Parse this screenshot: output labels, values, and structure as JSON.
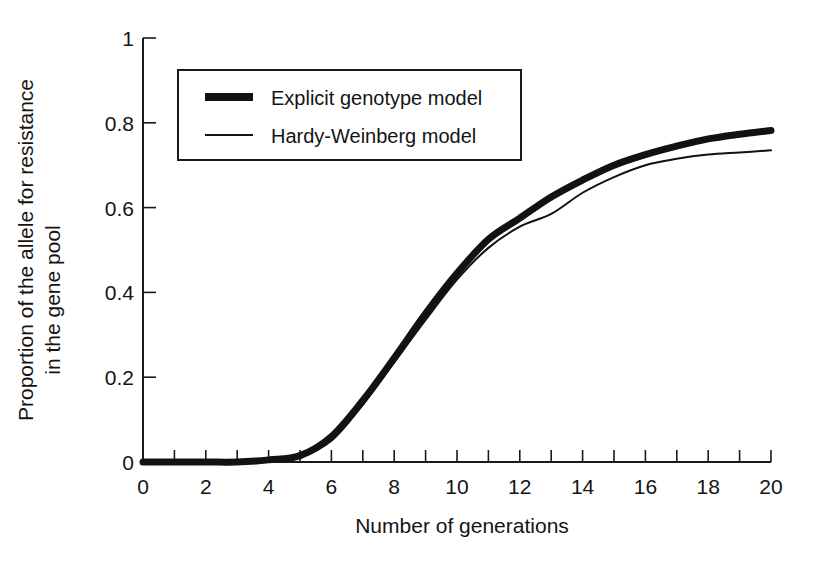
{
  "chart_data": {
    "type": "line",
    "title": "",
    "xlabel": "Number of generations",
    "ylabel": "Proportion of the allele for resistance in the gene pool",
    "ylabel_line1": "Proportion of the allele for resistance",
    "ylabel_line2": "in the gene pool",
    "xlim": [
      0,
      20
    ],
    "ylim": [
      0,
      1
    ],
    "xticks": [
      0,
      1,
      2,
      3,
      4,
      5,
      6,
      7,
      8,
      9,
      10,
      11,
      12,
      13,
      14,
      15,
      16,
      17,
      18,
      19,
      20
    ],
    "xtick_labels": [
      "0",
      "",
      "2",
      "",
      "4",
      "",
      "6",
      "",
      "8",
      "",
      "10",
      "",
      "12",
      "",
      "14",
      "",
      "16",
      "",
      "18",
      "",
      "20"
    ],
    "yticks": [
      0,
      0.2,
      0.4,
      0.6,
      0.8,
      1
    ],
    "ytick_labels": [
      "0",
      "0.2",
      "0.4",
      "0.6",
      "0.8",
      "1"
    ],
    "grid": false,
    "legend_position": "upper-left-inside",
    "x": [
      0,
      1,
      2,
      3,
      4,
      5,
      6,
      7,
      8,
      9,
      10,
      11,
      12,
      13,
      14,
      15,
      16,
      17,
      18,
      19,
      20
    ],
    "series": [
      {
        "name": "Explicit genotype model",
        "line_style": "thick",
        "color": "#121212",
        "values": [
          0.0,
          0.0,
          0.0,
          0.0,
          0.005,
          0.015,
          0.06,
          0.145,
          0.245,
          0.35,
          0.445,
          0.525,
          0.575,
          0.625,
          0.665,
          0.7,
          0.725,
          0.745,
          0.762,
          0.773,
          0.782
        ]
      },
      {
        "name": "Hardy-Weinberg model",
        "line_style": "thin",
        "color": "#121212",
        "values": [
          0.0,
          0.0,
          0.0,
          0.0,
          0.004,
          0.012,
          0.05,
          0.135,
          0.235,
          0.335,
          0.43,
          0.505,
          0.555,
          0.585,
          0.635,
          0.672,
          0.7,
          0.715,
          0.725,
          0.73,
          0.735
        ]
      }
    ]
  },
  "legend": {
    "entries": [
      {
        "label": "Explicit genotype model",
        "style": "thick"
      },
      {
        "label": "Hardy-Weinberg model",
        "style": "thin"
      }
    ]
  },
  "axes": {
    "x_title": "Number of generations",
    "y_title_line1": "Proportion of the allele for resistance",
    "y_title_line2": "in the gene pool",
    "x_tick_texts": [
      "0",
      "2",
      "4",
      "6",
      "8",
      "10",
      "12",
      "14",
      "16",
      "18",
      "20"
    ],
    "y_tick_texts": [
      "1",
      "0.8",
      "0.6",
      "0.4",
      "0.2",
      "0"
    ]
  }
}
